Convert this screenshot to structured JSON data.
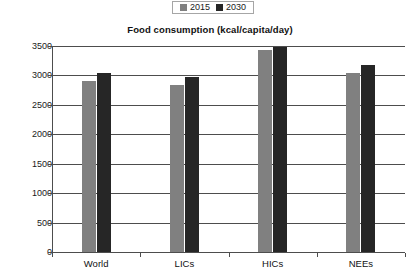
{
  "chart_data": {
    "type": "bar",
    "title": "Food consumption (kcal/capita/day)",
    "xlabel": "",
    "ylabel": "",
    "categories": [
      "World",
      "LICs",
      "HICs",
      "NEEs"
    ],
    "series": [
      {
        "name": "2015",
        "color": "#808080",
        "values": [
          2900,
          2830,
          3430,
          3050
        ]
      },
      {
        "name": "2030",
        "color": "#262626",
        "values": [
          3050,
          2980,
          3490,
          3180
        ]
      }
    ],
    "ylim": [
      0,
      3500
    ],
    "ytick_values": [
      0,
      500,
      1000,
      1500,
      2000,
      2500,
      3000,
      3500
    ],
    "ytick_labels": [
      "0",
      "500",
      "1000",
      "1500",
      "2000",
      "2500",
      "3000",
      "3500"
    ],
    "grid": true,
    "legend_position": "top-center"
  },
  "legend": {
    "entries": [
      {
        "label": "2015",
        "color": "#808080"
      },
      {
        "label": "2030",
        "color": "#262626"
      }
    ]
  },
  "colors": {
    "series_2015": "#808080",
    "series_2030": "#262626",
    "axis": "#4d4d4d",
    "text": "#1a1a1a",
    "background": "#ffffff"
  }
}
